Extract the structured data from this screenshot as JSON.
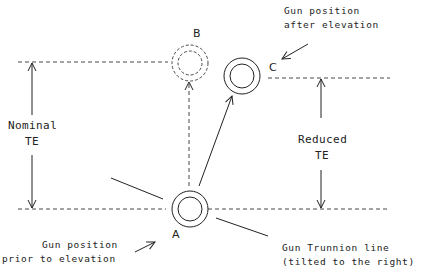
{
  "diagram": {
    "type": "gun trunnion elevation diagram",
    "colors": {
      "line": "#222222",
      "background": "#ffffff"
    },
    "points": {
      "A": {
        "label": "A",
        "style": "double-circle-solid"
      },
      "B": {
        "label": "B",
        "style": "double-circle-dashed"
      },
      "C": {
        "label": "C",
        "style": "double-circle-solid"
      }
    },
    "annotations": {
      "after_line1": "Gun position",
      "after_line2": "after elevation",
      "prior_line1": "Gun position",
      "prior_line2": "prior to elevation",
      "trunnion_line1": "Gun Trunnion line",
      "trunnion_line2": "(tilted to the right)",
      "nominal_line1": "Nominal",
      "nominal_line2": "TE",
      "reduced_line1": "Reduced",
      "reduced_line2": "TE"
    }
  }
}
